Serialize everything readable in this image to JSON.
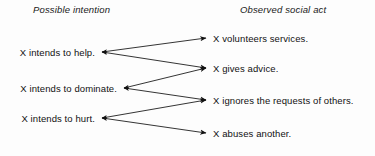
{
  "diagram": {
    "type": "mapping-diagram",
    "background_color": "#fdfdfd",
    "line_color": "#111111",
    "headers": {
      "left": "Possible intention",
      "right": "Observed social act"
    },
    "intentions": [
      {
        "id": "help",
        "label": "X intends to help.",
        "x": 100,
        "y": 52
      },
      {
        "id": "dominate",
        "label": "X intends to dominate.",
        "x": 122,
        "y": 88
      },
      {
        "id": "hurt",
        "label": "X intends to hurt.",
        "x": 100,
        "y": 118
      }
    ],
    "acts": [
      {
        "id": "volunteers",
        "label": "X volunteers services.",
        "x": 208,
        "y": 38
      },
      {
        "id": "advice",
        "label": "X gives advice.",
        "x": 208,
        "y": 68
      },
      {
        "id": "ignores",
        "label": "X ignores the requests of others.",
        "x": 208,
        "y": 100
      },
      {
        "id": "abuses",
        "label": "X abuses another.",
        "x": 208,
        "y": 133
      }
    ],
    "links": [
      {
        "from": "help",
        "to": "volunteers"
      },
      {
        "from": "help",
        "to": "advice"
      },
      {
        "from": "dominate",
        "to": "advice"
      },
      {
        "from": "dominate",
        "to": "ignores"
      },
      {
        "from": "hurt",
        "to": "ignores"
      },
      {
        "from": "hurt",
        "to": "abuses"
      }
    ]
  }
}
